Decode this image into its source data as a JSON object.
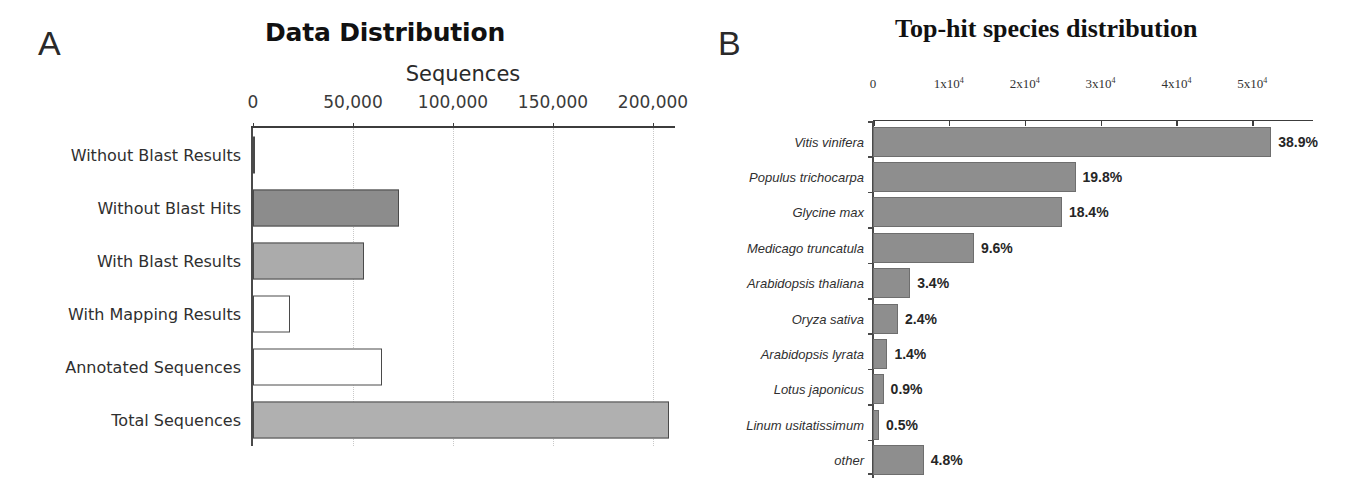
{
  "figure": {
    "panels": [
      {
        "letter": "A"
      },
      {
        "letter": "B"
      }
    ]
  },
  "chart_data": [
    {
      "type": "bar",
      "orientation": "horizontal",
      "panel": "A",
      "title": "Data Distribution",
      "xlabel": "Sequences",
      "ylabel": "",
      "xlim": [
        0,
        210000
      ],
      "grid": "vertical-dotted",
      "legend": "none",
      "ticks": [
        {
          "value": 0,
          "label": "0"
        },
        {
          "value": 50000,
          "label": "50,000"
        },
        {
          "value": 100000,
          "label": "100,000"
        },
        {
          "value": 150000,
          "label": "150,000"
        },
        {
          "value": 200000,
          "label": "200,000"
        }
      ],
      "categories": [
        "Without Blast Results",
        "Without Blast Hits",
        "With Blast Results",
        "With Mapping Results",
        "Annotated Sequences",
        "Total Sequences"
      ],
      "values": [
        500,
        73000,
        55500,
        18500,
        64500,
        208000
      ],
      "bar_colors": [
        "#ffffff",
        "#8c8c8c",
        "#ababab",
        "#ffffff",
        "#ffffff",
        "#b0b0b0"
      ],
      "bar_borders": [
        "#4a4a4a",
        "#4a4a4a",
        "#4a4a4a",
        "#4a4a4a",
        "#4a4a4a",
        "#4a4a4a"
      ]
    },
    {
      "type": "bar",
      "orientation": "horizontal",
      "panel": "B",
      "title": "Top-hit species distribution",
      "xlabel": "",
      "ylabel": "",
      "xlim": [
        0,
        58000
      ],
      "grid": "none",
      "legend": "none",
      "ticks": [
        {
          "value": 0,
          "label": "0",
          "mantissa": "0",
          "exponent": ""
        },
        {
          "value": 10000,
          "label": "1x10⁴",
          "mantissa": "1x10",
          "exponent": "4"
        },
        {
          "value": 20000,
          "label": "2x10⁴",
          "mantissa": "2x10",
          "exponent": "4"
        },
        {
          "value": 30000,
          "label": "3x10⁴",
          "mantissa": "3x10",
          "exponent": "4"
        },
        {
          "value": 40000,
          "label": "4x10⁴",
          "mantissa": "4x10",
          "exponent": "4"
        },
        {
          "value": 50000,
          "label": "5x10⁴",
          "mantissa": "5x10",
          "exponent": "4"
        }
      ],
      "categories": [
        "Vitis vinifera",
        "Populus trichocarpa",
        "Glycine max",
        "Medicago truncatula",
        "Arabidopsis thaliana",
        "Oryza sativa",
        "Arabidopsis lyrata",
        "Lotus japonicus",
        "Linum usitatissimum",
        "other"
      ],
      "values": [
        52500,
        26700,
        24900,
        13300,
        4900,
        3300,
        1900,
        1400,
        800,
        6700
      ],
      "data_labels": [
        "38.9%",
        "19.8%",
        "18.4%",
        "9.6%",
        "3.4%",
        "2.4%",
        "1.4%",
        "0.9%",
        "0.5%",
        "4.8%"
      ],
      "bar_color": "#8e8e8e",
      "bar_border": "#6e6e6e"
    }
  ]
}
